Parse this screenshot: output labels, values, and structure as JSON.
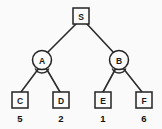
{
  "diagram": {
    "type": "game-tree",
    "background_color": "#fafafa",
    "stroke_color": "#232323",
    "root": {
      "id": "S",
      "label": "S",
      "shape": "square",
      "x": 81,
      "y": 16,
      "size": 16
    },
    "internal_nodes": [
      {
        "id": "A",
        "label": "A",
        "shape": "circle",
        "x": 42,
        "y": 60,
        "radius": 9.5,
        "has_angle_arc": true
      },
      {
        "id": "B",
        "label": "B",
        "shape": "circle",
        "x": 119,
        "y": 60,
        "radius": 9.5,
        "has_angle_arc": true
      }
    ],
    "leaf_nodes": [
      {
        "id": "C",
        "label": "C",
        "shape": "square",
        "x": 20,
        "y": 100,
        "size": 16,
        "value": "5",
        "value_y": 118,
        "parent": "A"
      },
      {
        "id": "D",
        "label": "D",
        "shape": "square",
        "x": 61,
        "y": 100,
        "size": 16,
        "value": "2",
        "value_y": 118,
        "parent": "A"
      },
      {
        "id": "E",
        "label": "E",
        "shape": "square",
        "x": 103,
        "y": 100,
        "size": 16,
        "value": "1",
        "value_y": 118,
        "parent": "B"
      },
      {
        "id": "F",
        "label": "F",
        "shape": "square",
        "x": 144,
        "y": 100,
        "size": 16,
        "value": "6",
        "value_y": 118,
        "parent": "B"
      }
    ],
    "edges": [
      {
        "id": "S-A",
        "from": "S",
        "to": "A",
        "x1": 76,
        "y1": 24,
        "x2": 47,
        "y2": 53
      },
      {
        "id": "S-B",
        "from": "S",
        "to": "B",
        "x1": 87,
        "y1": 24,
        "x2": 114,
        "y2": 53
      },
      {
        "id": "A-C",
        "from": "A",
        "to": "C",
        "x1": 39,
        "y1": 68,
        "x2": 21,
        "y2": 92
      },
      {
        "id": "A-D",
        "from": "A",
        "to": "D",
        "x1": 46,
        "y1": 68,
        "x2": 60,
        "y2": 92
      },
      {
        "id": "B-E",
        "from": "B",
        "to": "E",
        "x1": 116,
        "y1": 68,
        "x2": 103,
        "y2": 92
      },
      {
        "id": "B-F",
        "from": "B",
        "to": "F",
        "x1": 123,
        "y1": 68,
        "x2": 142,
        "y2": 92
      }
    ],
    "angle_arcs": [
      {
        "id": "arc-A",
        "node": "A",
        "cx": 42,
        "cy": 66,
        "r": 7
      },
      {
        "id": "arc-B",
        "node": "B",
        "cx": 119,
        "cy": 66,
        "r": 7
      }
    ]
  }
}
